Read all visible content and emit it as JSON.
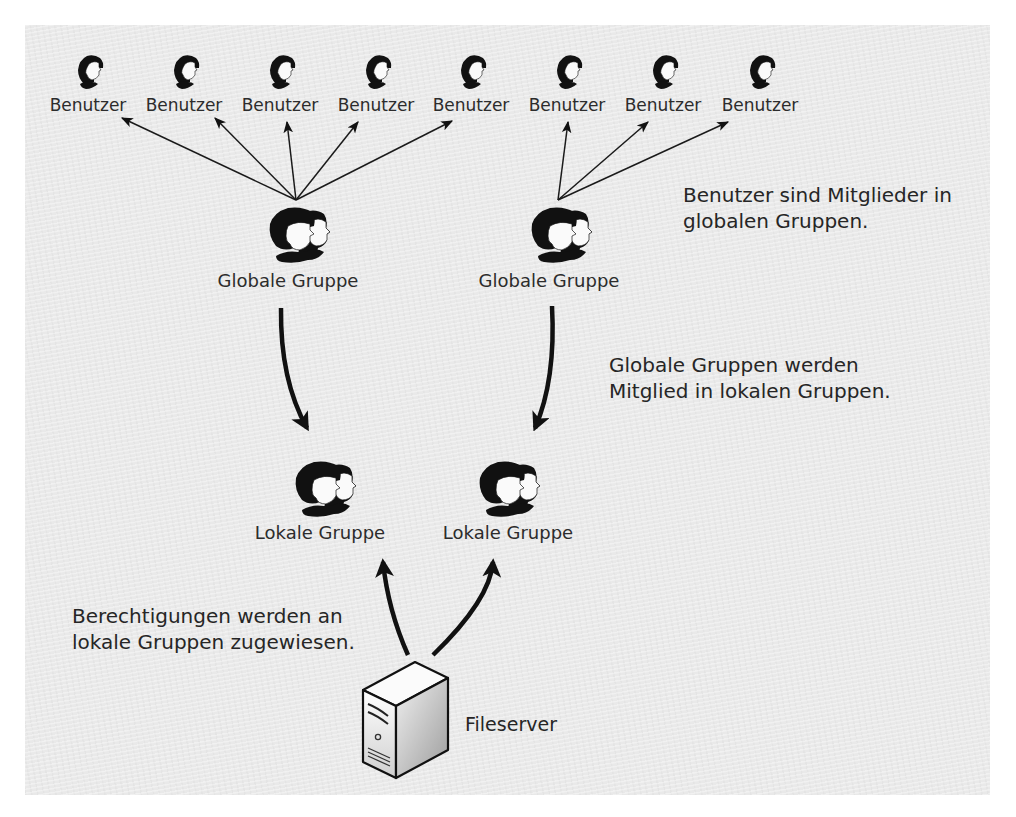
{
  "diagram": {
    "users": [
      {
        "label": "Benutzer",
        "x": 88
      },
      {
        "label": "Benutzer",
        "x": 184
      },
      {
        "label": "Benutzer",
        "x": 280
      },
      {
        "label": "Benutzer",
        "x": 376
      },
      {
        "label": "Benutzer",
        "x": 471
      },
      {
        "label": "Benutzer",
        "x": 567
      },
      {
        "label": "Benutzer",
        "x": 663
      },
      {
        "label": "Benutzer",
        "x": 760
      }
    ],
    "global_groups": [
      {
        "label": "Globale Gruppe",
        "x": 296
      },
      {
        "label": "Globale Gruppe",
        "x": 558
      }
    ],
    "local_groups": [
      {
        "label": "Lokale Gruppe",
        "x": 318
      },
      {
        "label": "Lokale Gruppe",
        "x": 508
      }
    ],
    "server": {
      "label": "Fileserver",
      "icon": "server-icon"
    },
    "notes": {
      "users_in_global": [
        "Benutzer sind Mitglieder in",
        "globalen Gruppen."
      ],
      "global_in_local": [
        "Globale Gruppen werden",
        "Mitglied in lokalen Gruppen."
      ],
      "permissions_local": [
        "Berechtigungen werden an",
        "lokale Gruppen zugewiesen."
      ]
    },
    "icons": {
      "user": "user-icon",
      "group": "group-icon",
      "server": "server-icon"
    },
    "colors": {
      "background": "#e9e9e9",
      "ink": "#111111",
      "text": "#2c2c2c"
    }
  }
}
